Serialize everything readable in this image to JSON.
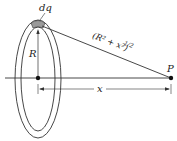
{
  "diagram": {
    "labels": {
      "charge_element": "dq",
      "radius": "R",
      "distance": "(R² + x²)",
      "distance_exponent": "1/2",
      "point": "P",
      "axis_distance": "x"
    },
    "colors": {
      "stroke": "#333333",
      "charge_fill": "#9a9a9a",
      "background": "#ffffff"
    }
  }
}
